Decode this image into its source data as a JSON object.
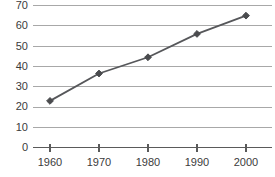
{
  "chart_data": {
    "type": "line",
    "title": "",
    "subtitle": "",
    "xlabel": "",
    "ylabel": "",
    "categories": [
      "1960",
      "1970",
      "1980",
      "1990",
      "2000"
    ],
    "x": [
      1960,
      1970,
      1980,
      1990,
      2000
    ],
    "values": [
      23,
      36.5,
      44.5,
      56,
      65
    ],
    "series": [
      {
        "name": "",
        "values": [
          23,
          36.5,
          44.5,
          56,
          65
        ]
      }
    ],
    "ylim": [
      0,
      70
    ],
    "xlim": [
      1955,
      2005
    ],
    "ytick_labels": [
      "0",
      "10",
      "20",
      "30",
      "40",
      "50",
      "60",
      "70"
    ],
    "ytick_values": [
      0,
      10,
      20,
      30,
      40,
      50,
      60,
      70
    ],
    "xtick_labels": [
      "1960",
      "1970",
      "1980",
      "1990",
      "2000"
    ],
    "grid": "horizontal",
    "legend": "none",
    "marker": "diamond",
    "colors": {
      "line": "#56575a",
      "marker": "#4a4b4e",
      "gridline": "#a8a8a8",
      "axis": "#5a5a5a",
      "tick_text": "#3b3b3b",
      "background": "#ffffff"
    }
  }
}
